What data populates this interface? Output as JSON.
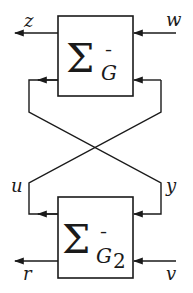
{
  "diagram": {
    "type": "lower linear fractional transformation / feedback interconnection",
    "colors": {
      "stroke": "#1a1a1a",
      "background": "#ffffff"
    },
    "top_block": {
      "symbol": "Σ",
      "subscript": "G",
      "subscript_accent": "¯",
      "subscript_index": ""
    },
    "bottom_block": {
      "symbol": "Σ",
      "subscript": "G",
      "subscript_accent": "¯",
      "subscript_index": "2"
    },
    "signals": {
      "z": "z",
      "w": "w",
      "u": "u",
      "y": "y",
      "r": "r",
      "v": "v"
    }
  }
}
